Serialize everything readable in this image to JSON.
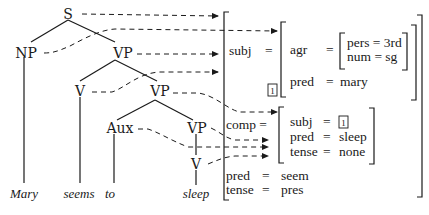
{
  "tree": {
    "nodes": {
      "s": "S",
      "np": "NP",
      "vp1": "VP",
      "v1": "V",
      "vp2": "VP",
      "aux": "Aux",
      "vp3": "VP",
      "v3": "V"
    },
    "leaves": {
      "mary": "Mary",
      "seems": "seems",
      "to": "to",
      "sleep": "sleep"
    }
  },
  "fstructure": {
    "subj": {
      "label": "subj",
      "eq": "=",
      "agr": {
        "label": "agr",
        "eq": "=",
        "pers": "pers = 3rd",
        "num": "num = sg"
      },
      "pred": {
        "label": "pred",
        "eq": "=",
        "value": "mary"
      },
      "tag": "1"
    },
    "comp": {
      "label": "comp =",
      "subj": {
        "label": "subj",
        "eq": "=",
        "tag": "1"
      },
      "pred": {
        "label": "pred",
        "eq": "=",
        "value": "sleep"
      },
      "tense": {
        "label": "tense",
        "eq": "=",
        "value": "none"
      }
    },
    "pred": {
      "label": "pred",
      "eq": "=",
      "value": "seem"
    },
    "tense": {
      "label": "tense",
      "eq": "=",
      "value": "pres"
    }
  },
  "colors": {
    "ink": "#1a1a1a",
    "background": "#ffffff"
  }
}
